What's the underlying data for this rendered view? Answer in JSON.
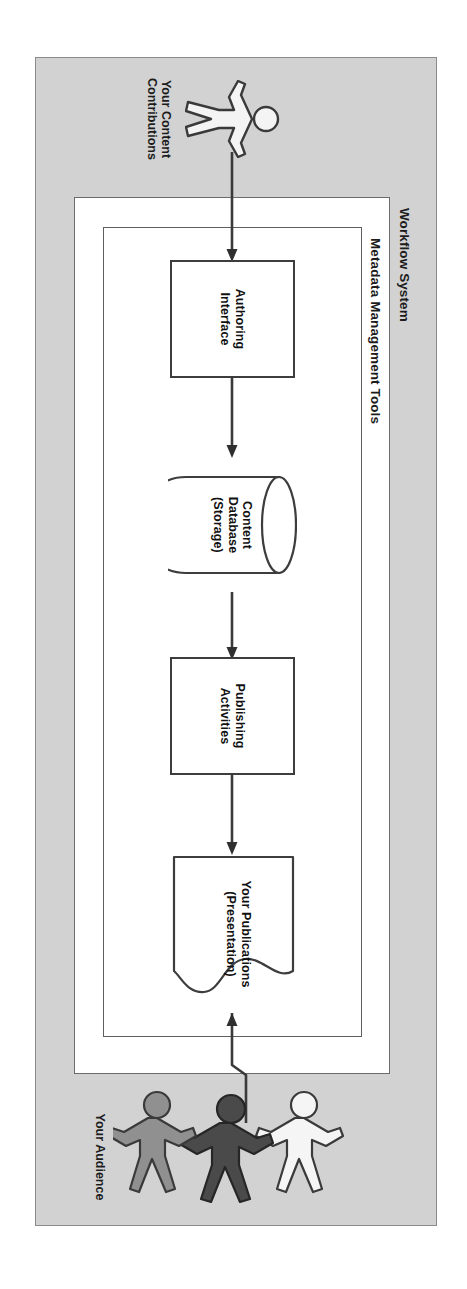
{
  "diagram": {
    "orientation_note": "rotated 90 degrees",
    "colors": {
      "outer_frame_fill": "#d2d2d2",
      "outer_frame_stroke": "#8b8b8b",
      "inner_frame_fill": "#ffffff",
      "node_stroke": "#3d3d3d",
      "text": "#111111",
      "figure_gray": "#8a8a8a",
      "figure_dark": "#4a4a4a",
      "figure_light": "#f2f2f2"
    },
    "frames": [
      {
        "name": "workflow-system",
        "label": "Workflow System"
      },
      {
        "name": "metadata-management-tools",
        "label": "Metadata Management Tools"
      }
    ],
    "nodes": [
      {
        "name": "authoring-interface",
        "label": "Authoring Interface",
        "shape": "rectangle"
      },
      {
        "name": "content-database",
        "label_line1": "Content",
        "label_line2": "Database",
        "label_line3": "(Storage)",
        "shape": "cylinder"
      },
      {
        "name": "publishing-activities",
        "label_line1": "Publishing",
        "label_line2": "Activities",
        "shape": "rectangle"
      },
      {
        "name": "your-publications",
        "label_line1": "Your Publications",
        "label_line2": "(Presentation)",
        "shape": "document"
      }
    ],
    "actors": [
      {
        "name": "content-contributor",
        "caption_line1": "Your Content",
        "caption_line2": "Contributions",
        "figure_count": 1
      },
      {
        "name": "audience",
        "caption": "Your Audience",
        "figure_count": 3
      }
    ],
    "arrows": [
      {
        "name": "contributor-to-authoring",
        "from": "content-contributor",
        "to": "authoring-interface"
      },
      {
        "name": "authoring-to-database",
        "from": "authoring-interface",
        "to": "content-database"
      },
      {
        "name": "database-to-publishing",
        "from": "content-database",
        "to": "publishing-activities"
      },
      {
        "name": "publishing-to-publications",
        "from": "publishing-activities",
        "to": "your-publications"
      },
      {
        "name": "publications-to-audience",
        "from": "your-publications",
        "to": "audience"
      }
    ]
  }
}
